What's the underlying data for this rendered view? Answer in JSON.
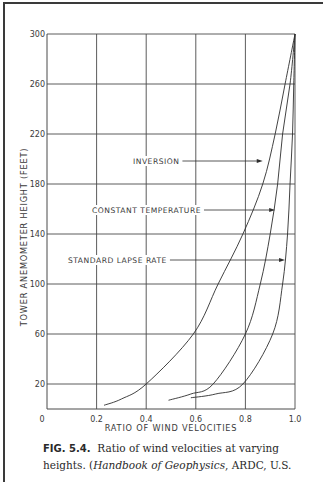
{
  "chart_data": {
    "type": "line",
    "title": "",
    "xlabel": "RATIO OF WIND VELOCITIES",
    "ylabel": "TOWER ANEMOMETER HEIGHT (FEET)",
    "xlim": [
      0,
      1.0
    ],
    "ylim": [
      0,
      300
    ],
    "xticks": [
      0,
      0.2,
      0.4,
      0.6,
      0.8,
      1.0
    ],
    "xtick_labels": [
      "0",
      "0.2",
      "0.4",
      "0.6",
      "0.8",
      "1.0"
    ],
    "yticks": [
      20,
      60,
      100,
      140,
      180,
      220,
      260,
      300
    ],
    "ytick_labels": [
      "20",
      "60",
      "100",
      "140",
      "180",
      "220",
      "260",
      "300"
    ],
    "grid": true,
    "legend": "inline-annotations",
    "series": [
      {
        "name": "INVERSION",
        "x": [
          0.23,
          0.3,
          0.4,
          0.59,
          0.69,
          0.79,
          0.87,
          0.92,
          0.96,
          1.0
        ],
        "y": [
          3,
          8,
          20,
          60,
          100,
          140,
          180,
          220,
          260,
          300
        ]
      },
      {
        "name": "CONSTANT TEMPERATURE",
        "x": [
          0.49,
          0.58,
          0.67,
          0.8,
          0.86,
          0.9,
          0.93,
          0.95,
          0.98,
          1.0
        ],
        "y": [
          7,
          12,
          20,
          60,
          100,
          140,
          180,
          220,
          260,
          300
        ]
      },
      {
        "name": "STANDARD LAPSE RATE",
        "x": [
          0.58,
          0.68,
          0.79,
          0.91,
          0.95,
          0.97,
          0.98,
          0.99,
          0.995,
          1.0
        ],
        "y": [
          9,
          12,
          20,
          60,
          100,
          140,
          180,
          220,
          260,
          300
        ]
      }
    ],
    "annotations": [
      {
        "text": "INVERSION",
        "arrow_to": {
          "x": 0.87,
          "y": 182
        }
      },
      {
        "text": "CONSTANT TEMPERATURE",
        "arrow_to": {
          "x": 0.92,
          "y": 162
        }
      },
      {
        "text": "STANDARD LAPSE RATE",
        "arrow_to": {
          "x": 0.96,
          "y": 120
        }
      }
    ]
  },
  "caption": {
    "fig_label": "FIG. 5.4.",
    "line1_text": "Ratio of wind velocities at varying",
    "line2_prefix": "heights. (",
    "line2_italic": "Handbook of Geophysics",
    "line2_suffix": ", ARDC, U.S."
  },
  "colors": {
    "line": "#2e2e2e",
    "grid": "#4a4a4a",
    "text": "#3a3a3a"
  }
}
